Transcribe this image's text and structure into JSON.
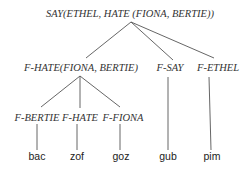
{
  "tree": {
    "root": {
      "label": "SAY(ETHEL, HATE (FIONA, BERTIE))"
    },
    "level1": [
      {
        "label": "F-HATE(FIONA, BERTIE)"
      },
      {
        "label": "F-SAY"
      },
      {
        "label": "F-ETHEL"
      }
    ],
    "level2": [
      {
        "label": "F-BERTIE"
      },
      {
        "label": "F-HATE"
      },
      {
        "label": "F-FIONA"
      }
    ],
    "leaves": [
      {
        "label": "bac"
      },
      {
        "label": "zof"
      },
      {
        "label": "goz"
      },
      {
        "label": "gub"
      },
      {
        "label": "pim"
      }
    ]
  }
}
